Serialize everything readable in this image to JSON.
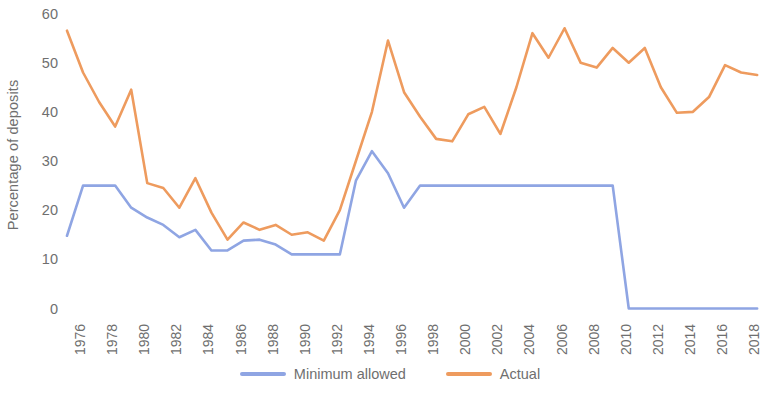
{
  "chart_data": {
    "type": "line",
    "title": "",
    "subtitle": "",
    "xlabel": "",
    "ylabel": "Percentage of deposits",
    "xlim": [
      1976,
      2019
    ],
    "ylim": [
      0,
      60
    ],
    "grid": false,
    "legend_position": "bottom",
    "y_ticks": [
      0,
      10,
      20,
      30,
      40,
      50,
      60
    ],
    "x_ticks": [
      1976,
      1978,
      1980,
      1982,
      1984,
      1986,
      1988,
      1990,
      1992,
      1994,
      1996,
      1998,
      2000,
      2002,
      2004,
      2006,
      2008,
      2010,
      2012,
      2014,
      2016,
      2018
    ],
    "x": [
      1976,
      1977,
      1978,
      1979,
      1980,
      1981,
      1982,
      1983,
      1984,
      1985,
      1986,
      1987,
      1988,
      1989,
      1990,
      1991,
      1992,
      1993,
      1994,
      1995,
      1996,
      1997,
      1998,
      1999,
      2000,
      2001,
      2002,
      2003,
      2004,
      2005,
      2006,
      2007,
      2008,
      2009,
      2010,
      2011,
      2012,
      2013,
      2014,
      2015,
      2016,
      2017,
      2018,
      2019
    ],
    "series": [
      {
        "name": "Minimum allowed",
        "color": "#8FA5E3",
        "values": [
          14.8,
          25.0,
          25.0,
          25.0,
          20.5,
          18.5,
          17.0,
          14.5,
          16.0,
          11.8,
          11.8,
          13.8,
          14.0,
          13.0,
          11.0,
          11.0,
          11.0,
          11.0,
          26.0,
          32.0,
          27.5,
          20.5,
          25.0,
          25.0,
          25.0,
          25.0,
          25.0,
          25.0,
          25.0,
          25.0,
          25.0,
          25.0,
          25.0,
          25.0,
          25.0,
          0.0,
          0.0,
          0.0,
          0.0,
          0.0,
          0.0,
          0.0,
          0.0,
          0.0
        ]
      },
      {
        "name": "Actual",
        "color": "#EE9B5E",
        "values": [
          56.5,
          48.0,
          42.0,
          37.0,
          44.5,
          25.5,
          24.5,
          20.5,
          26.5,
          19.5,
          14.0,
          17.5,
          16.0,
          17.0,
          15.0,
          15.5,
          13.8,
          20.0,
          30.0,
          40.0,
          54.5,
          44.0,
          39.0,
          34.5,
          34.0,
          39.5,
          41.0,
          35.5,
          45.0,
          56.0,
          51.0,
          57.0,
          50.0,
          49.0,
          53.0,
          50.0,
          53.0,
          45.0,
          39.8,
          40.0,
          43.0,
          49.5,
          48.0,
          47.5
        ]
      }
    ]
  },
  "legend": {
    "items": [
      {
        "label": "Minimum allowed",
        "color": "#8FA5E3"
      },
      {
        "label": "Actual",
        "color": "#EE9B5E"
      }
    ]
  }
}
